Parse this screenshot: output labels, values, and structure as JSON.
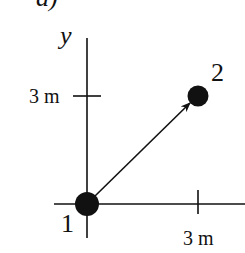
{
  "figure": {
    "panel_label_fragment": "a)",
    "y_axis_label": "y",
    "y_tick_label": "3 m",
    "x_tick_label": "3 m",
    "points": [
      {
        "label": "1",
        "x_m": 0,
        "y_m": 0
      },
      {
        "label": "2",
        "x_m": 3,
        "y_m": 3
      }
    ],
    "arrow": {
      "from": "1",
      "to": "2"
    },
    "colors": {
      "ink": "#111111",
      "background": "#ffffff"
    }
  }
}
